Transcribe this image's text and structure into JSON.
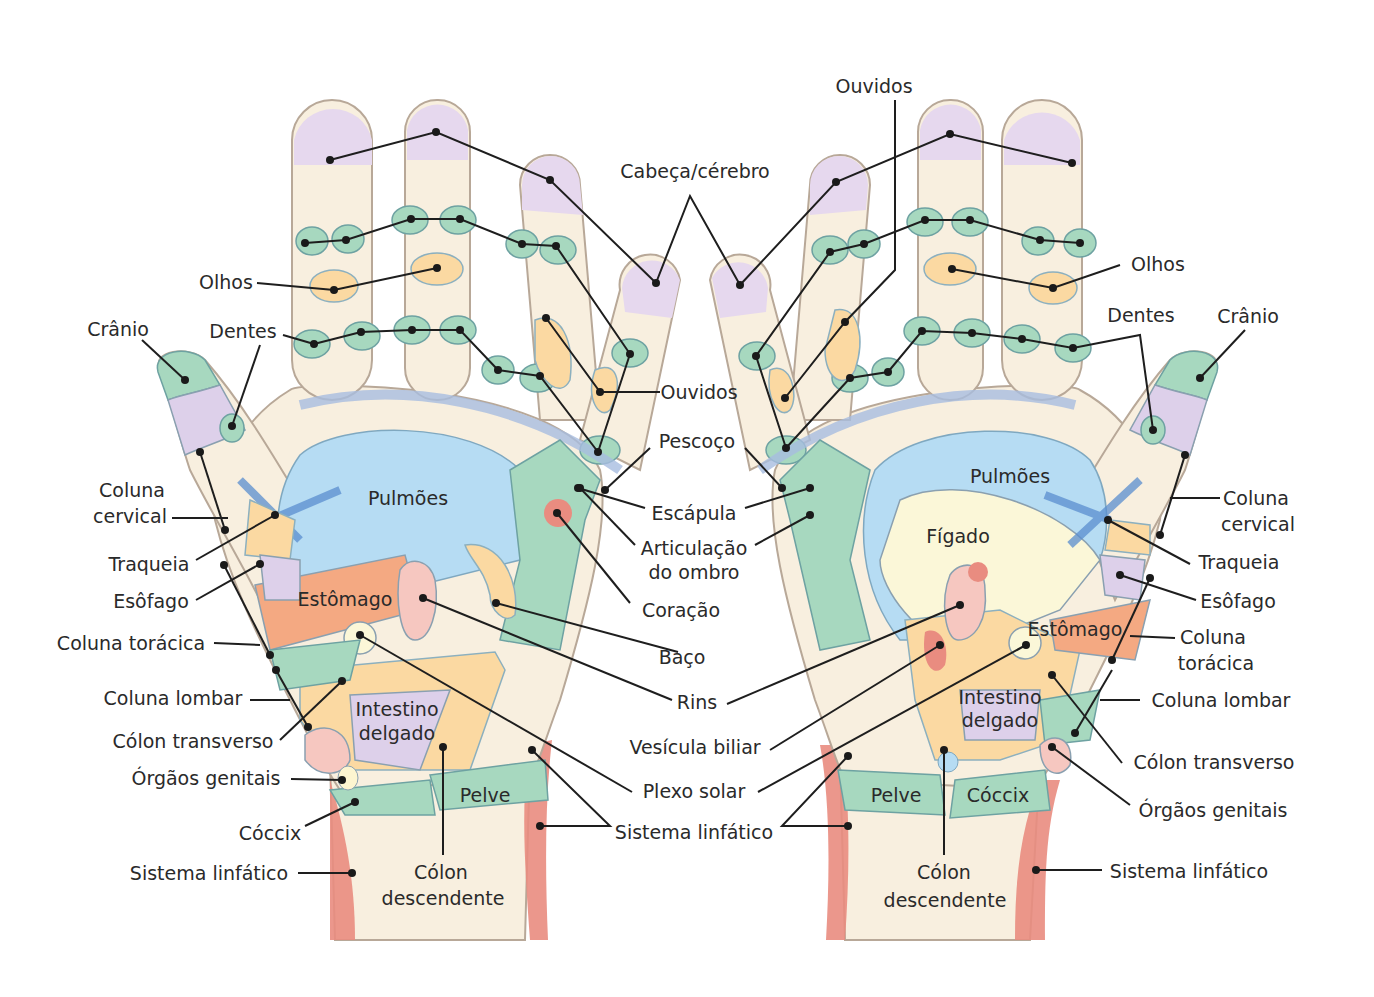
{
  "colors": {
    "skin": "#f8efdf",
    "fingertip_head": "#e6d8ee",
    "green_zones": "#a7d8bf",
    "yellow_zones": "#fbd9a2",
    "lungs_blue": "#b6dcf3",
    "stomach_orange": "#f4a982",
    "lymphatic_red": "#e98c80",
    "kidney_pink": "#f6c7c0",
    "liver_cream": "#fbf7d8"
  },
  "left_hand": {
    "inner_labels": {
      "lungs": "Pulmões",
      "stomach": "Estômago",
      "small_intestine_1": "Intestino",
      "small_intestine_2": "delgado",
      "pelvis": "Pelve"
    },
    "labels": {
      "eyes": "Olhos",
      "skull": "Crânio",
      "teeth": "Dentes",
      "cervical_1": "Coluna",
      "cervical_2": "cervical",
      "trachea": "Traqueia",
      "esophagus": "Esôfago",
      "thoracic": "Coluna torácica",
      "lumbar": "Coluna lombar",
      "transverse_colon": "Cólon transverso",
      "genitals": "Órgãos genitais",
      "coccyx": "Cóccix",
      "lymphatic": "Sistema linfático",
      "descending_colon_1": "Cólon",
      "descending_colon_2": "descendente"
    }
  },
  "center_labels": {
    "head_brain": "Cabeça/cérebro",
    "ears_top": "Ouvidos",
    "ears_mid": "Ouvidos",
    "neck": "Pescoço",
    "scapula": "Escápula",
    "shoulder_1": "Articulação",
    "shoulder_2": "do ombro",
    "heart": "Coração",
    "spleen": "Baço",
    "kidneys": "Rins",
    "gallbladder": "Vesícula biliar",
    "solar_plexus": "Plexo solar",
    "lymphatic": "Sistema linfático"
  },
  "right_hand": {
    "inner_labels": {
      "lungs": "Pulmões",
      "liver": "Fígado",
      "stomach": "Estômago",
      "small_intestine_1": "Intestino",
      "small_intestine_2": "delgado",
      "pelvis": "Pelve",
      "coccyx": "Cóccix"
    },
    "labels": {
      "eyes": "Olhos",
      "teeth": "Dentes",
      "skull": "Crânio",
      "cervical_1": "Coluna",
      "cervical_2": "cervical",
      "trachea": "Traqueia",
      "esophagus": "Esôfago",
      "thoracic_1": "Coluna",
      "thoracic_2": "torácica",
      "lumbar": "Coluna lombar",
      "transverse_colon": "Cólon transverso",
      "genitals": "Órgãos genitais",
      "lymphatic": "Sistema linfático",
      "descending_colon_1": "Cólon",
      "descending_colon_2": "descendente"
    }
  }
}
